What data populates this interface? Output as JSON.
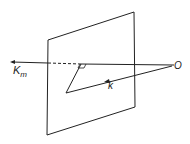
{
  "diagram": {
    "labels": {
      "km_main": "K",
      "km_sub": "m",
      "k": "k",
      "origin": "O"
    },
    "colors": {
      "stroke": "#222222",
      "background": "#ffffff"
    },
    "elements": [
      "plane",
      "axis-line-to-Km",
      "vector-k",
      "perpendicular-foot-mark"
    ]
  }
}
